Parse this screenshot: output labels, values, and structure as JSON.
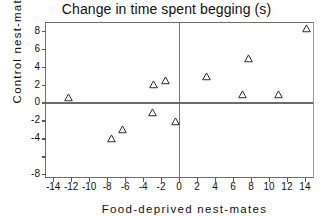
{
  "chart_data": {
    "type": "scatter",
    "title": "Change in time spent begging (s)",
    "xlabel": "Food-deprived nest-mates",
    "ylabel": "Control  nest-mates",
    "xlim": [
      -14.8,
      14.9
    ],
    "ylim": [
      -8.3,
      8.85
    ],
    "xticks": [
      -14,
      -12,
      -10,
      -8,
      -6,
      -4,
      -2,
      0,
      2,
      4,
      6,
      8,
      10,
      12,
      14
    ],
    "xticklabels": [
      "-14",
      "-12",
      "-10",
      "-8",
      "-6",
      "-4",
      "-2",
      "0",
      "2",
      "4",
      "6",
      "8",
      "10",
      "12",
      "14"
    ],
    "yticks": [
      8,
      6,
      4,
      2,
      0,
      -2,
      -4,
      -6,
      -8
    ],
    "yticklabels": [
      "8",
      "6",
      "4",
      "2",
      "0",
      "-2",
      "-4",
      "",
      "-8"
    ],
    "grid": false,
    "legend": null,
    "reference_lines": [
      {
        "axis": "x",
        "value": 0
      },
      {
        "axis": "y",
        "value": 0
      }
    ],
    "marker_style": "open-triangle",
    "marker_color": "#2b2b2b",
    "series": [
      {
        "name": "nestlings",
        "points": [
          {
            "x": -12.3,
            "y": 0.5
          },
          {
            "x": -7.5,
            "y": -4.0
          },
          {
            "x": -6.3,
            "y": -3.0
          },
          {
            "x": -2.9,
            "y": -1.1
          },
          {
            "x": -2.8,
            "y": 2.0
          },
          {
            "x": -1.5,
            "y": 2.4
          },
          {
            "x": -0.4,
            "y": -2.1
          },
          {
            "x": 3.1,
            "y": 2.9
          },
          {
            "x": 7.1,
            "y": 0.9
          },
          {
            "x": 7.7,
            "y": 4.9
          },
          {
            "x": 11.1,
            "y": 0.85
          },
          {
            "x": 14.2,
            "y": 8.2
          }
        ]
      }
    ],
    "n_points": 12
  },
  "colors": {
    "background": "#ffffff",
    "axis": "#6e6e6e",
    "text": "#111111",
    "marker": "#2b2b2b"
  }
}
